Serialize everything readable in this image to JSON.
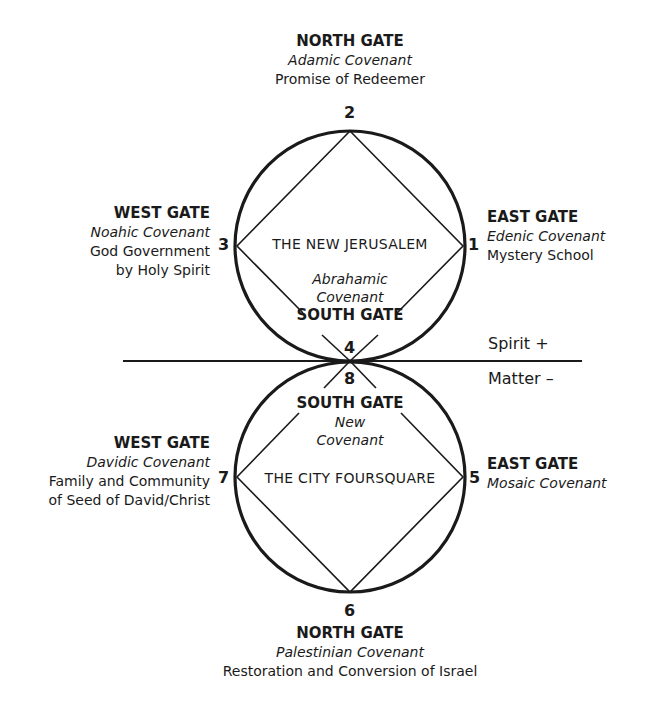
{
  "upper": {
    "city_name": "THE NEW JERUSALEM",
    "north": {
      "number": "2",
      "gate": "NORTH GATE",
      "covenant": "Adamic Covenant",
      "desc": [
        "Promise of Redeemer"
      ]
    },
    "east": {
      "number": "1",
      "gate": "EAST GATE",
      "covenant": "Edenic Covenant",
      "desc": [
        "Mystery School"
      ]
    },
    "west": {
      "number": "3",
      "gate": "WEST GATE",
      "covenant": "Noahic Covenant",
      "desc": [
        "God Government",
        "by Holy Spirit"
      ]
    },
    "south": {
      "number": "4",
      "gate": "SOUTH GATE",
      "covenant_lines": [
        "Abrahamic",
        "Covenant"
      ]
    }
  },
  "lower": {
    "city_name": "THE CITY FOURSQUARE",
    "south": {
      "number": "8",
      "gate": "SOUTH GATE",
      "covenant_lines": [
        "New",
        "Covenant"
      ]
    },
    "east": {
      "number": "5",
      "gate": "EAST GATE",
      "covenant": "Mosaic Covenant"
    },
    "west": {
      "number": "7",
      "gate": "WEST GATE",
      "covenant": "Davidic Covenant",
      "desc": [
        "Family and Community",
        "of Seed of David/Christ"
      ]
    },
    "north": {
      "number": "6",
      "gate": "NORTH GATE",
      "covenant": "Palestinian Covenant",
      "desc": [
        "Restoration and Conversion of Israel"
      ]
    }
  },
  "axis": {
    "above": "Spirit  +",
    "below": "Matter  –"
  },
  "colors": {
    "stroke": "#1a1a1a",
    "background": "#ffffff"
  }
}
